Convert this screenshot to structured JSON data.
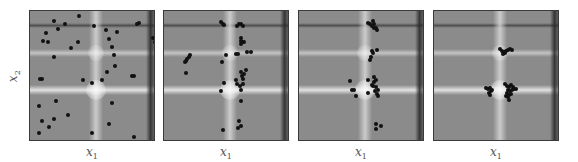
{
  "chart_data": {
    "type": "scatter",
    "xlabel": "x1",
    "ylabel": "x2",
    "xlim": [
      0,
      126
    ],
    "ylim": [
      0,
      131
    ],
    "grid": false,
    "legend": null,
    "background": {
      "base_color": "#8b8b8b",
      "horizontal_dark_band_y": 14,
      "horizontal_light_band_y": 42,
      "horizontal_bright_band_y": 79,
      "vertical_light_band_x": 66,
      "vertical_dark_band_x": 120
    },
    "panels": [
      {
        "index": 1,
        "points": [
          [
            49,
            5
          ],
          [
            24,
            10
          ],
          [
            35,
            13
          ],
          [
            28,
            18
          ],
          [
            64,
            15
          ],
          [
            76,
            19
          ],
          [
            87,
            21
          ],
          [
            107,
            13
          ],
          [
            109,
            12
          ],
          [
            16,
            22
          ],
          [
            13,
            30
          ],
          [
            18,
            31
          ],
          [
            48,
            31
          ],
          [
            41,
            37
          ],
          [
            79,
            28
          ],
          [
            82,
            36
          ],
          [
            84,
            44
          ],
          [
            24,
            46
          ],
          [
            85,
            55
          ],
          [
            77,
            61
          ],
          [
            10,
            68
          ],
          [
            12,
            68
          ],
          [
            53,
            69
          ],
          [
            62,
            72
          ],
          [
            72,
            69
          ],
          [
            102,
            65
          ],
          [
            104,
            65
          ],
          [
            123,
            27
          ],
          [
            125,
            31
          ],
          [
            26,
            90
          ],
          [
            82,
            92
          ],
          [
            9,
            95
          ],
          [
            38,
            104
          ],
          [
            24,
            108
          ],
          [
            12,
            110
          ],
          [
            19,
            116
          ],
          [
            79,
            113
          ],
          [
            9,
            122
          ],
          [
            62,
            122
          ],
          [
            104,
            126
          ]
        ]
      },
      {
        "index": 2,
        "points": [
          [
            57,
            11
          ],
          [
            59,
            13
          ],
          [
            60,
            14
          ],
          [
            73,
            15
          ],
          [
            75,
            13
          ],
          [
            77,
            13
          ],
          [
            79,
            15
          ],
          [
            77,
            27
          ],
          [
            77,
            30
          ],
          [
            79,
            31
          ],
          [
            77,
            33
          ],
          [
            80,
            31
          ],
          [
            26,
            44
          ],
          [
            25,
            46
          ],
          [
            23,
            48
          ],
          [
            22,
            50
          ],
          [
            21,
            51
          ],
          [
            62,
            44
          ],
          [
            58,
            51
          ],
          [
            72,
            43
          ],
          [
            74,
            43
          ],
          [
            83,
            41
          ],
          [
            87,
            41
          ],
          [
            22,
            62
          ],
          [
            77,
            61
          ],
          [
            80,
            63
          ],
          [
            82,
            59
          ],
          [
            78,
            65
          ],
          [
            79,
            68
          ],
          [
            60,
            72
          ],
          [
            72,
            69
          ],
          [
            73,
            73
          ],
          [
            76,
            75
          ],
          [
            79,
            73
          ],
          [
            77,
            79
          ],
          [
            57,
            80
          ],
          [
            77,
            90
          ],
          [
            75,
            110
          ],
          [
            77,
            115
          ],
          [
            74,
            117
          ],
          [
            59,
            119
          ]
        ]
      },
      {
        "index": 3,
        "points": [
          [
            69,
            12
          ],
          [
            71,
            13
          ],
          [
            73,
            15
          ],
          [
            74,
            10
          ],
          [
            75,
            13
          ],
          [
            77,
            17
          ],
          [
            78,
            19
          ],
          [
            75,
            17
          ],
          [
            73,
            40
          ],
          [
            74,
            42
          ],
          [
            78,
            39
          ],
          [
            72,
            46
          ],
          [
            71,
            49
          ],
          [
            51,
            70
          ],
          [
            69,
            69
          ],
          [
            75,
            66
          ],
          [
            77,
            69
          ],
          [
            75,
            71
          ],
          [
            73,
            74
          ],
          [
            74,
            75
          ],
          [
            77,
            76
          ],
          [
            79,
            79
          ],
          [
            76,
            80
          ],
          [
            78,
            83
          ],
          [
            79,
            85
          ],
          [
            53,
            79
          ],
          [
            55,
            79
          ],
          [
            69,
            82
          ],
          [
            57,
            85
          ],
          [
            77,
            113
          ],
          [
            82,
            115
          ],
          [
            77,
            118
          ]
        ]
      },
      {
        "index": 4,
        "points": [
          [
            66,
            38
          ],
          [
            68,
            40
          ],
          [
            70,
            41
          ],
          [
            72,
            40
          ],
          [
            74,
            39
          ],
          [
            76,
            38
          ],
          [
            78,
            39
          ],
          [
            69,
            43
          ],
          [
            71,
            42
          ],
          [
            52,
            77
          ],
          [
            54,
            78
          ],
          [
            56,
            77
          ],
          [
            58,
            79
          ],
          [
            55,
            82
          ],
          [
            56,
            84
          ],
          [
            57,
            80
          ],
          [
            71,
            73
          ],
          [
            73,
            75
          ],
          [
            75,
            76
          ],
          [
            77,
            74
          ],
          [
            79,
            76
          ],
          [
            74,
            79
          ],
          [
            76,
            80
          ],
          [
            78,
            79
          ],
          [
            80,
            78
          ],
          [
            73,
            82
          ],
          [
            75,
            84
          ],
          [
            77,
            83
          ],
          [
            72,
            85
          ],
          [
            74,
            86
          ],
          [
            75,
            89
          ],
          [
            82,
            78
          ]
        ]
      }
    ]
  },
  "axes": {
    "xlabel": "x",
    "xlabel_sub": "1",
    "ylabel": "x",
    "ylabel_sub": "2"
  }
}
